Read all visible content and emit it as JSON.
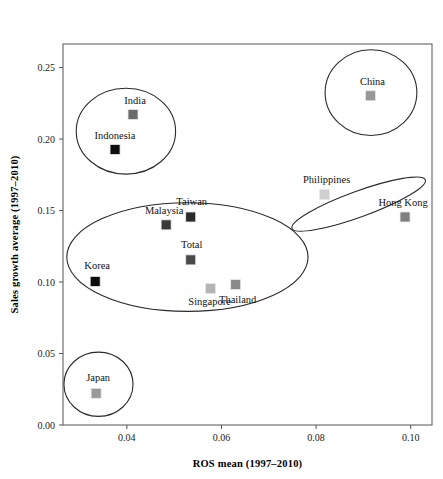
{
  "chart_data": {
    "type": "scatter",
    "title": "",
    "xlabel": "ROS mean (1997–2010)",
    "ylabel": "Sales growth average (1997–2010)",
    "xlim": [
      0.0265,
      0.1045
    ],
    "ylim": [
      0.0,
      0.2665
    ],
    "xticks": [
      0.04,
      0.06,
      0.08,
      0.1
    ],
    "xtick_labels": [
      "0.04",
      "0.06",
      "0.08",
      "0.10"
    ],
    "yticks": [
      0.0,
      0.05,
      0.1,
      0.15,
      0.2,
      0.25
    ],
    "ytick_labels": [
      "0.00",
      "0.05",
      "0.10",
      "0.15",
      "0.20",
      "0.25"
    ],
    "grid": false,
    "legend": "none",
    "marker": "square",
    "points": [
      {
        "label": "India",
        "x": 0.0413,
        "y": 0.2172,
        "color": "#6b6b6b",
        "label_dx": 2,
        "label_dy": -10,
        "label_anchor": "middle"
      },
      {
        "label": "Indonesia",
        "x": 0.0375,
        "y": 0.1927,
        "color": "#0d0d0d",
        "label_dx": 0,
        "label_dy": -11,
        "label_anchor": "middle"
      },
      {
        "label": "China",
        "x": 0.0915,
        "y": 0.2303,
        "color": "#989898",
        "label_dx": 2,
        "label_dy": -11,
        "label_anchor": "middle"
      },
      {
        "label": "Philippines",
        "x": 0.0818,
        "y": 0.1613,
        "color": "#d0d0d0",
        "label_dx": 2,
        "label_dy": -11,
        "label_anchor": "middle"
      },
      {
        "label": "Hong Kong",
        "x": 0.0988,
        "y": 0.1455,
        "color": "#808080",
        "label_dx": -2,
        "label_dy": -11,
        "label_anchor": "middle"
      },
      {
        "label": "Taiwan",
        "x": 0.0535,
        "y": 0.1455,
        "color": "#2b2b2b",
        "label_dx": 1,
        "label_dy": -12,
        "label_anchor": "middle"
      },
      {
        "label": "Malaysia",
        "x": 0.0483,
        "y": 0.14,
        "color": "#3a3a3a",
        "label_dx": -2,
        "label_dy": -11,
        "label_anchor": "middle"
      },
      {
        "label": "Total",
        "x": 0.0535,
        "y": 0.1155,
        "color": "#4a4a4a",
        "label_dx": 1,
        "label_dy": -12,
        "label_anchor": "middle"
      },
      {
        "label": "Korea",
        "x": 0.0333,
        "y": 0.1004,
        "color": "#0d0d0d",
        "label_dx": 2,
        "label_dy": -12,
        "label_anchor": "middle"
      },
      {
        "label": "Singapore",
        "x": 0.0577,
        "y": 0.0955,
        "color": "#b4b4b4",
        "label_dx": -1,
        "label_dy": 17,
        "label_anchor": "middle"
      },
      {
        "label": "Thailand",
        "x": 0.063,
        "y": 0.0982,
        "color": "#8a8a8a",
        "label_dx": 2,
        "label_dy": 18,
        "label_anchor": "middle"
      },
      {
        "label": "Japan",
        "x": 0.0335,
        "y": 0.0222,
        "color": "#9a9a9a",
        "label_dx": 2,
        "label_dy": -12,
        "label_anchor": "middle"
      }
    ],
    "clusters": [
      {
        "name": "india-indonesia-cluster",
        "cx": 0.0398,
        "cy": 0.2055,
        "rx": 0.0105,
        "ry": 0.03,
        "rotation": 0
      },
      {
        "name": "china-cluster",
        "cx": 0.0916,
        "cy": 0.2325,
        "rx": 0.0097,
        "ry": 0.03,
        "rotation": 0
      },
      {
        "name": "philippines-hongkong-cluster",
        "cx": 0.089,
        "cy": 0.1545,
        "rx": 0.015,
        "ry": 0.009,
        "rotation": -20
      },
      {
        "name": "core-asia-cluster",
        "cx": 0.0528,
        "cy": 0.1175,
        "rx": 0.0255,
        "ry": 0.038,
        "rotation": 0
      },
      {
        "name": "japan-cluster",
        "cx": 0.034,
        "cy": 0.0285,
        "rx": 0.0073,
        "ry": 0.0225,
        "rotation": 0
      }
    ]
  },
  "axes": {
    "x_axis_label": "ROS mean (1997–2010)",
    "y_axis_label": "Sales growth average (1997–2010)"
  }
}
